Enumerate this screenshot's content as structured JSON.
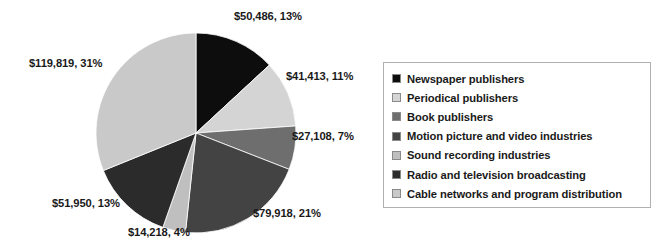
{
  "chart_data": {
    "type": "pie",
    "title": "",
    "legend_position": "right",
    "start_angle_deg": 0,
    "direction": "clockwise",
    "categories": [
      "Newspaper publishers",
      "Periodical publishers",
      "Book publishers",
      "Motion picture and video industries",
      "Sound recording industries",
      "Radio and television broadcasting",
      "Cable networks and program distribution"
    ],
    "values": [
      50486,
      41413,
      27108,
      79918,
      14218,
      51950,
      119819
    ],
    "percentages": [
      13,
      11,
      7,
      21,
      4,
      13,
      31
    ],
    "colors": [
      "#0d0d0d",
      "#d4d4d4",
      "#6e6e6e",
      "#434343",
      "#bfbfbf",
      "#2b2b2b",
      "#c9c9c9"
    ],
    "data_labels": [
      "$50,486, 13%",
      "$41,413, 11%",
      "$27,108, 7%",
      "$79,918, 21%",
      "$14,218, 4%",
      "$51,950, 13%",
      "$119,819, 31%"
    ]
  },
  "legend": {
    "items": [
      {
        "label": "Newspaper publishers",
        "color": "#0d0d0d"
      },
      {
        "label": "Periodical publishers",
        "color": "#d4d4d4"
      },
      {
        "label": "Book publishers",
        "color": "#6e6e6e"
      },
      {
        "label": "Motion picture and video industries",
        "color": "#434343"
      },
      {
        "label": "Sound recording industries",
        "color": "#bfbfbf"
      },
      {
        "label": "Radio and television broadcasting",
        "color": "#2b2b2b"
      },
      {
        "label": "Cable networks and program distribution",
        "color": "#c9c9c9"
      }
    ]
  },
  "labels": {
    "newspaper": "$50,486, 13%",
    "periodical": "$41,413, 11%",
    "book": "$27,108, 7%",
    "motion_picture": "$79,918, 21%",
    "sound_recording": "$14,218, 4%",
    "radio_tv": "$51,950, 13%",
    "cable": "$119,819, 31%"
  }
}
